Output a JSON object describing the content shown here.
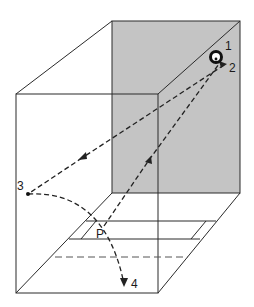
{
  "figure": {
    "colors": {
      "line": "#2a2a2a",
      "shade": "#c4c4c4",
      "background": "#ffffff"
    },
    "labels": {
      "p1": "1",
      "p2": "2",
      "p3": "3",
      "p4": "4",
      "pP": "P"
    },
    "points": {
      "source_1": [
        216,
        57
      ],
      "reflection_2": [
        224,
        65
      ],
      "reflection_3": [
        28,
        194
      ],
      "floor_P": [
        104,
        226
      ],
      "end_4": [
        124,
        285
      ]
    },
    "paths": [
      {
        "from": "2",
        "to": "3",
        "style": "dashed",
        "arrow": "toward 3"
      },
      {
        "from": "P",
        "to": "2",
        "style": "dashed",
        "arrow": "toward 2"
      },
      {
        "from": "3",
        "to": "4",
        "style": "dashed-curve",
        "arrow": "toward 4"
      }
    ]
  }
}
